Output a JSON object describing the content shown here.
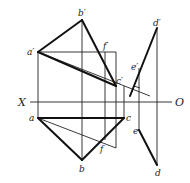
{
  "diagram": {
    "type": "orthographic-projection",
    "axis": {
      "left_label": "X",
      "right_label": "O"
    },
    "front_view_labels": {
      "a": "a′",
      "b": "b′",
      "c": "c′",
      "d": "d′",
      "e": "e′",
      "f": "f′"
    },
    "top_view_labels": {
      "a": "a",
      "b": "b",
      "c": "c",
      "d": "d",
      "e": "e",
      "f": "f"
    },
    "annotations": {
      "right_angle_marker": "perpendicular at e′ to a′c′"
    },
    "colors": {
      "line": "#111111",
      "background": "#ffffff"
    }
  }
}
